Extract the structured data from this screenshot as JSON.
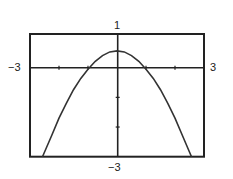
{
  "chart_data": {
    "type": "line",
    "title": "",
    "xlabel": "",
    "ylabel": "",
    "xlim": [
      -3,
      3
    ],
    "ylim": [
      -3,
      1
    ],
    "grid": false,
    "window_labels": {
      "xmin": "−3",
      "xmax": "3",
      "ymin": "−3",
      "ymax": "1"
    },
    "series": [
      {
        "name": "curve",
        "x": [
          -2.57,
          -2.25,
          -2.0,
          -1.75,
          -1.5,
          -1.25,
          -1.0,
          -0.75,
          -0.5,
          -0.25,
          0.0,
          0.25,
          0.5,
          0.75,
          1.0,
          1.25,
          1.5,
          1.75,
          2.0,
          2.25,
          2.57
        ],
        "y": [
          -3.0,
          -2.28,
          -1.7,
          -1.2,
          -0.74,
          -0.36,
          -0.05,
          0.19,
          0.36,
          0.47,
          0.5,
          0.47,
          0.36,
          0.19,
          -0.05,
          -0.36,
          -0.74,
          -1.2,
          -1.7,
          -2.28,
          -3.0
        ]
      }
    ]
  }
}
